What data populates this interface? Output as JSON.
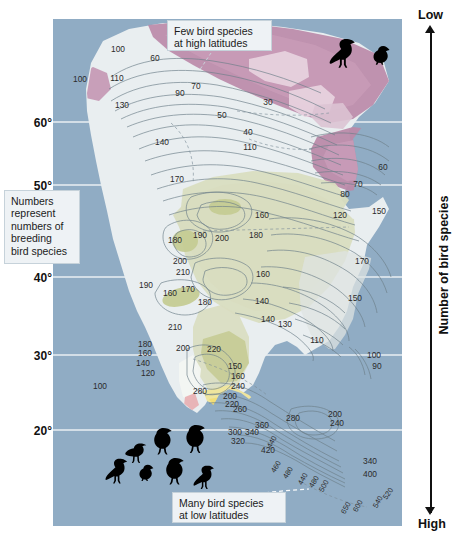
{
  "figure": {
    "type": "contour-map"
  },
  "y_axis": {
    "title": "Latitude",
    "ticks": [
      "60°",
      "50°",
      "40°",
      "30°",
      "20°"
    ]
  },
  "right_axis": {
    "title": "Number of bird species",
    "top_label": "Low",
    "bottom_label": "High"
  },
  "callouts": {
    "high_latitude": {
      "line1": "Few bird species",
      "line2": "at high latitudes"
    },
    "legend_note": {
      "line1": "Numbers",
      "line2": "represent",
      "line3": "numbers of",
      "line4": "breeding",
      "line5": "bird species"
    },
    "low_latitude": {
      "line1": "Many bird species",
      "line2": "at low latitudes"
    }
  },
  "icons": {
    "birds_top": [
      "bird-silhouette",
      "bird-silhouette-small"
    ],
    "birds_bottom": [
      "bird-silhouette",
      "bird-silhouette",
      "bird-silhouette",
      "bird-silhouette",
      "bird-silhouette",
      "bird-silhouette",
      "bird-silhouette"
    ]
  },
  "colors": {
    "ocean": "#8fabc4",
    "land_pale": "#e9eef0",
    "land_green": "#d9ddc0",
    "land_green_dark": "#c5cb93",
    "magenta": "#bb8aa9",
    "magenta_light": "#d9b9cd",
    "magenta_pale": "#e7d2de",
    "yellow": "#f0e39a",
    "orange": "#e98a2d",
    "red": "#e8321a",
    "grid": "#f2f6f8",
    "contour": "#6d7f8a",
    "text": "#111111"
  },
  "chart_data": {
    "type": "contour",
    "xlabel": "",
    "ylabel": "Latitude",
    "ylim": [
      15,
      72
    ],
    "grid": true,
    "legend_position": "right",
    "units": "number of breeding bird species",
    "contour_levels": [
      30,
      40,
      50,
      60,
      70,
      80,
      90,
      100,
      110,
      120,
      130,
      140,
      150,
      160,
      170,
      180,
      190,
      200,
      210,
      220,
      240,
      260,
      280,
      300,
      320,
      340,
      360,
      400,
      420,
      440,
      460,
      480,
      500,
      520,
      540,
      560,
      600,
      650
    ],
    "labels": [
      {
        "value": "100",
        "x": 118,
        "y": 52
      },
      {
        "value": "60",
        "x": 155,
        "y": 61
      },
      {
        "value": "100",
        "x": 80,
        "y": 82
      },
      {
        "value": "110",
        "x": 117,
        "y": 81
      },
      {
        "value": "90",
        "x": 180,
        "y": 96
      },
      {
        "value": "70",
        "x": 196,
        "y": 89
      },
      {
        "value": "130",
        "x": 122,
        "y": 108
      },
      {
        "value": "30",
        "x": 268,
        "y": 105
      },
      {
        "value": "50",
        "x": 222,
        "y": 118
      },
      {
        "value": "40",
        "x": 248,
        "y": 135
      },
      {
        "value": "140",
        "x": 162,
        "y": 145
      },
      {
        "value": "110",
        "x": 250,
        "y": 150
      },
      {
        "value": "60",
        "x": 383,
        "y": 170
      },
      {
        "value": "70",
        "x": 358,
        "y": 187
      },
      {
        "value": "80",
        "x": 345,
        "y": 197
      },
      {
        "value": "170",
        "x": 177,
        "y": 182
      },
      {
        "value": "160",
        "x": 262,
        "y": 218
      },
      {
        "value": "120",
        "x": 340,
        "y": 218
      },
      {
        "value": "150",
        "x": 379,
        "y": 214
      },
      {
        "value": "180",
        "x": 175,
        "y": 243
      },
      {
        "value": "190",
        "x": 200,
        "y": 238
      },
      {
        "value": "200",
        "x": 222,
        "y": 241
      },
      {
        "value": "180",
        "x": 256,
        "y": 238
      },
      {
        "value": "160",
        "x": 263,
        "y": 277
      },
      {
        "value": "170",
        "x": 362,
        "y": 264
      },
      {
        "value": "200",
        "x": 180,
        "y": 264
      },
      {
        "value": "210",
        "x": 183,
        "y": 275
      },
      {
        "value": "190",
        "x": 146,
        "y": 288
      },
      {
        "value": "160",
        "x": 170,
        "y": 296
      },
      {
        "value": "170",
        "x": 188,
        "y": 292
      },
      {
        "value": "180",
        "x": 205,
        "y": 305
      },
      {
        "value": "140",
        "x": 262,
        "y": 304
      },
      {
        "value": "140",
        "x": 268,
        "y": 322
      },
      {
        "value": "150",
        "x": 355,
        "y": 301
      },
      {
        "value": "130",
        "x": 285,
        "y": 327
      },
      {
        "value": "210",
        "x": 175,
        "y": 330
      },
      {
        "value": "180",
        "x": 145,
        "y": 347
      },
      {
        "value": "160",
        "x": 145,
        "y": 356
      },
      {
        "value": "200",
        "x": 183,
        "y": 351
      },
      {
        "value": "220",
        "x": 214,
        "y": 352
      },
      {
        "value": "140",
        "x": 143,
        "y": 366
      },
      {
        "value": "120",
        "x": 148,
        "y": 376
      },
      {
        "value": "110",
        "x": 317,
        "y": 343
      },
      {
        "value": "100",
        "x": 100,
        "y": 389
      },
      {
        "value": "100",
        "x": 374,
        "y": 358
      },
      {
        "value": "90",
        "x": 377,
        "y": 369
      },
      {
        "value": "150",
        "x": 235,
        "y": 369
      },
      {
        "value": "160",
        "x": 238,
        "y": 379
      },
      {
        "value": "240",
        "x": 238,
        "y": 389
      },
      {
        "value": "280",
        "x": 200,
        "y": 394
      },
      {
        "value": "200",
        "x": 230,
        "y": 399
      },
      {
        "value": "220",
        "x": 232,
        "y": 407
      },
      {
        "value": "260",
        "x": 240,
        "y": 412
      },
      {
        "value": "280",
        "x": 293,
        "y": 421
      },
      {
        "value": "200",
        "x": 335,
        "y": 417
      },
      {
        "value": "240",
        "x": 337,
        "y": 426
      },
      {
        "value": "360",
        "x": 262,
        "y": 428
      },
      {
        "value": "300",
        "x": 235,
        "y": 435
      },
      {
        "value": "340",
        "x": 252,
        "y": 435
      },
      {
        "value": "320",
        "x": 238,
        "y": 444
      },
      {
        "value": "440",
        "x": 274,
        "y": 443
      },
      {
        "value": "420",
        "x": 268,
        "y": 453
      },
      {
        "value": "460",
        "x": 278,
        "y": 468
      },
      {
        "value": "480",
        "x": 290,
        "y": 474
      },
      {
        "value": "440",
        "x": 305,
        "y": 480
      },
      {
        "value": "480",
        "x": 316,
        "y": 483
      },
      {
        "value": "500",
        "x": 326,
        "y": 487
      },
      {
        "value": "340",
        "x": 370,
        "y": 464
      },
      {
        "value": "400",
        "x": 370,
        "y": 477
      },
      {
        "value": "520",
        "x": 390,
        "y": 495
      },
      {
        "value": "540",
        "x": 380,
        "y": 503
      },
      {
        "value": "600",
        "x": 360,
        "y": 507
      },
      {
        "value": "650",
        "x": 348,
        "y": 509
      }
    ]
  }
}
